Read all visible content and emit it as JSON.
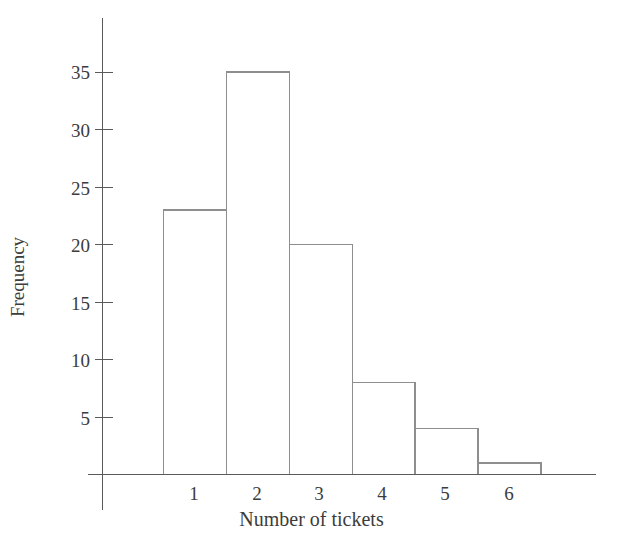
{
  "chart_data": {
    "type": "bar",
    "title": "",
    "subtitle": "",
    "xlabel": "Number of tickets",
    "ylabel": "Frequency",
    "categories": [
      "1",
      "2",
      "3",
      "4",
      "5",
      "6"
    ],
    "values": [
      23,
      35,
      20,
      8,
      4,
      1
    ],
    "series": [
      {
        "name": "Frequency",
        "values": [
          23,
          35,
          20,
          8,
          4,
          1
        ]
      }
    ],
    "ylim": [
      0,
      38
    ],
    "xlim": [
      0.5,
      6.5
    ],
    "yticks": [
      5,
      10,
      15,
      20,
      25,
      30,
      35
    ],
    "ytick_labels": [
      "5",
      "10",
      "15",
      "20",
      "25",
      "30",
      "35"
    ],
    "xtick_labels": [
      "1",
      "2",
      "3",
      "4",
      "5",
      "6"
    ],
    "grid": false,
    "legend": null,
    "legend_position": "none",
    "bar_fill_color": "#ffffff",
    "bar_edge_color": "#8e8e8e",
    "axis_color": "#5a5a5a",
    "background_color": "#ffffff",
    "annotations": []
  }
}
